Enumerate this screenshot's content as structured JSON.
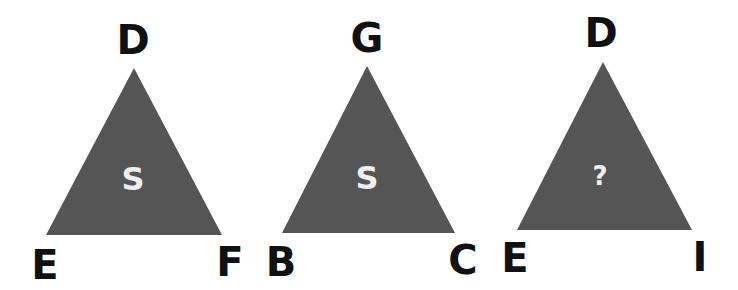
{
  "puzzle": {
    "fill_color": "#555555",
    "triangles": [
      {
        "top": "D",
        "bottom_left": "E",
        "bottom_right": "F",
        "center": "S"
      },
      {
        "top": "G",
        "bottom_left": "B",
        "bottom_right": "C",
        "center": "S"
      },
      {
        "top": "D",
        "bottom_left": "E",
        "bottom_right": "I",
        "center": "?"
      }
    ]
  }
}
